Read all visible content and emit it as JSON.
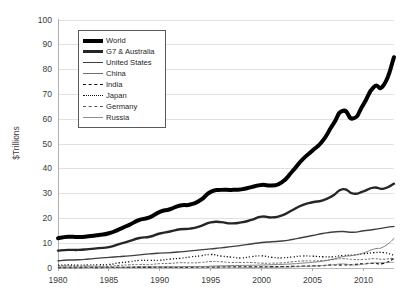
{
  "chart_data": {
    "type": "line",
    "title": "",
    "xlabel": "",
    "ylabel": "$Trillions",
    "xlim": [
      1980,
      2013
    ],
    "ylim": [
      0,
      100
    ],
    "ytick_step": 10,
    "xtick_step": 5,
    "grid": true,
    "legend_position": "upper-left-inside",
    "y_ticks": [
      "0",
      "10",
      "20",
      "30",
      "40",
      "50",
      "60",
      "70",
      "80",
      "90",
      "100"
    ],
    "x_ticks": [
      "1980",
      "1985",
      "1990",
      "1995",
      "2000",
      "2005",
      "2010"
    ],
    "x": [
      1980,
      1981,
      1982,
      1983,
      1984,
      1985,
      1986,
      1987,
      1988,
      1989,
      1990,
      1991,
      1992,
      1993,
      1994,
      1995,
      1996,
      1997,
      1998,
      1999,
      2000,
      2001,
      2002,
      2003,
      2004,
      2005,
      2006,
      2007,
      2008,
      2009,
      2010,
      2011,
      2012,
      2013
    ],
    "series": [
      {
        "name": "World",
        "style": "solid",
        "width": 4.0,
        "color": "#000000",
        "values": [
          12.0,
          12.6,
          12.5,
          12.8,
          13.3,
          14.0,
          15.6,
          17.4,
          19.4,
          20.4,
          22.6,
          23.7,
          25.2,
          25.6,
          27.4,
          30.7,
          31.5,
          31.5,
          31.7,
          32.6,
          33.5,
          33.3,
          34.6,
          38.9,
          43.7,
          47.4,
          51.3,
          57.8,
          63.4,
          60.3,
          66.0,
          72.9,
          73.8,
          85.0
        ]
      },
      {
        "name": "G7 & Australia",
        "style": "solid",
        "width": 2.4,
        "color": "#262626",
        "values": [
          7.0,
          7.3,
          7.3,
          7.6,
          8.0,
          8.4,
          9.6,
          10.8,
          12.1,
          12.6,
          13.9,
          14.7,
          15.6,
          15.9,
          16.9,
          18.4,
          18.5,
          18.0,
          18.4,
          19.4,
          20.7,
          20.4,
          21.2,
          23.3,
          25.4,
          26.5,
          27.3,
          29.2,
          31.8,
          30.0,
          30.9,
          32.4,
          32.0,
          34.0
        ]
      },
      {
        "name": "United States",
        "style": "solid",
        "width": 1.4,
        "color": "#3f3f3f",
        "values": [
          2.9,
          3.2,
          3.3,
          3.6,
          4.0,
          4.3,
          4.6,
          4.9,
          5.3,
          5.7,
          6.0,
          6.2,
          6.5,
          6.9,
          7.3,
          7.7,
          8.1,
          8.6,
          9.1,
          9.7,
          10.3,
          10.6,
          10.9,
          11.5,
          12.3,
          13.1,
          13.9,
          14.5,
          14.7,
          14.4,
          15.0,
          15.5,
          16.2,
          16.8
        ]
      },
      {
        "name": "China",
        "style": "solid",
        "width": 0.9,
        "color": "#6e6e6e",
        "values": [
          0.3,
          0.29,
          0.28,
          0.3,
          0.31,
          0.31,
          0.3,
          0.33,
          0.41,
          0.46,
          0.4,
          0.41,
          0.49,
          0.62,
          0.56,
          0.73,
          0.86,
          0.96,
          1.03,
          1.09,
          1.21,
          1.34,
          1.47,
          1.66,
          1.96,
          2.29,
          2.75,
          3.55,
          4.6,
          5.1,
          6.1,
          7.6,
          8.6,
          11.9
        ]
      },
      {
        "name": "India",
        "style": "dashed",
        "width": 1.3,
        "color": "#111111",
        "values": [
          0.19,
          0.2,
          0.2,
          0.22,
          0.21,
          0.23,
          0.25,
          0.28,
          0.3,
          0.3,
          0.33,
          0.28,
          0.29,
          0.29,
          0.34,
          0.37,
          0.41,
          0.43,
          0.43,
          0.47,
          0.48,
          0.5,
          0.53,
          0.62,
          0.72,
          0.84,
          0.95,
          1.24,
          1.22,
          1.37,
          1.71,
          1.87,
          1.86,
          3.9
        ]
      },
      {
        "name": "Japan",
        "style": "dotted",
        "width": 1.3,
        "color": "#111111",
        "values": [
          1.1,
          1.22,
          1.13,
          1.24,
          1.32,
          1.4,
          2.08,
          2.5,
          3.07,
          3.05,
          3.13,
          3.58,
          3.91,
          4.46,
          4.91,
          5.45,
          4.83,
          4.42,
          4.03,
          4.56,
          4.89,
          4.3,
          4.12,
          4.44,
          4.82,
          4.76,
          4.53,
          4.52,
          5.04,
          5.23,
          5.7,
          6.16,
          6.2,
          5.2
        ]
      },
      {
        "name": "Germany",
        "style": "dashed",
        "width": 0.9,
        "color": "#565656",
        "values": [
          0.95,
          0.82,
          0.78,
          0.77,
          0.72,
          0.73,
          1.05,
          1.28,
          1.4,
          1.4,
          1.76,
          1.87,
          2.13,
          2.07,
          2.2,
          2.59,
          2.51,
          2.22,
          2.24,
          2.2,
          1.95,
          1.95,
          2.08,
          2.51,
          2.82,
          2.86,
          3.0,
          3.44,
          3.75,
          3.42,
          3.42,
          3.76,
          3.54,
          4.1
        ]
      },
      {
        "name": "Russia",
        "style": "solid",
        "width": 0.8,
        "color": "#8c8c8c",
        "values": [
          0.0,
          0.0,
          0.0,
          0.0,
          0.0,
          0.0,
          0.0,
          0.0,
          0.0,
          0.0,
          0.57,
          0.52,
          0.46,
          0.44,
          0.4,
          0.4,
          0.39,
          0.4,
          0.27,
          0.2,
          0.26,
          0.31,
          0.35,
          0.43,
          0.59,
          0.76,
          0.99,
          1.3,
          1.66,
          1.22,
          1.52,
          2.05,
          2.21,
          2.3
        ]
      }
    ]
  },
  "colors": {
    "grid": "#d9d9d9",
    "axis": "#a6a6a6",
    "text": "#3b3b3b",
    "legend_border": "#595959",
    "background": "#ffffff"
  }
}
